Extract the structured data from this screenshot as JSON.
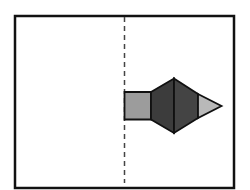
{
  "diagram": {
    "frame": {
      "x": 15,
      "y": 16,
      "width": 219,
      "height": 172,
      "stroke": "#111111",
      "stroke_width": 2.5
    },
    "axis": {
      "x": 124.5,
      "y1": 17,
      "y2": 183,
      "stroke": "#444444",
      "dash": "5,4"
    },
    "shapes": {
      "square": {
        "points": "124.5,92 151,92 151,119.5 124.5,119.5",
        "fill": "#9c9c9c"
      },
      "hexagon_left": {
        "points": "151,92 174,78.5 174,133 151,119.5",
        "fill": "#3c3c3c"
      },
      "hexagon_right": {
        "points": "174,78.5 198,94 198,118 174,133",
        "fill": "#444444"
      },
      "triangle": {
        "points": "198,94 221.5,106 198,118",
        "fill": "#b9b9b9"
      }
    },
    "outline_color": "#111111"
  }
}
